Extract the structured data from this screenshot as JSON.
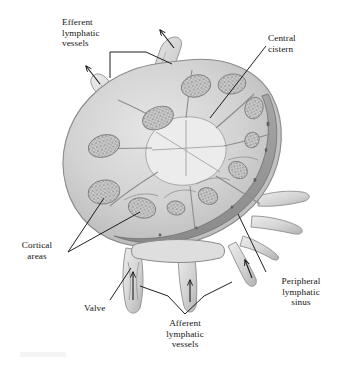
{
  "figure": {
    "style": "grayscale pen-and-ink anatomical illustration",
    "background_color": "#ffffff",
    "ink_color": "#141414"
  },
  "labels": {
    "efferent": {
      "text": "Efferent\nlymphatic\nvessels",
      "align": "left",
      "leader": "bracket with two branches to upper-left vessels"
    },
    "central_cistern": {
      "text": "Central\ncistern",
      "align": "left",
      "leader": "diagonal line down-left into pale central space"
    },
    "cortical": {
      "text": "Cortical\nareas",
      "align": "center",
      "leader": "two diverging lines to stippled cortical nodules"
    },
    "valve": {
      "text": "Valve",
      "align": "left",
      "leader": "diagonal line up-right into afferent vessel lumen"
    },
    "afferent": {
      "text": "Afferent\nlymphatic\nvessels",
      "align": "center",
      "leader": "inverted V to two lower vessels"
    },
    "peripheral": {
      "text": "Peripheral\nlymphatic\nsinus",
      "align": "center",
      "leader": "diagonal line up-left to dark marginal sinus band"
    }
  },
  "anatomy": {
    "cortical_nodules": 11,
    "efferent_vessels": 2,
    "afferent_vessels": 4,
    "flow_arrows": {
      "efferent_outward": 2,
      "afferent_inward": 3
    },
    "colors": {
      "capsule": "#b9b9b9",
      "cortex_wash": "#cfcfcf",
      "medulla_light": "#e2e2e2",
      "sinus_dark": "#9a9a9a",
      "nodule_stipple": "#8d8d8d",
      "vessel_fill": "#dcdcdc"
    }
  }
}
